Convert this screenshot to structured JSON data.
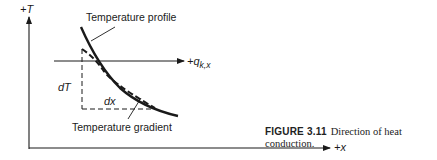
{
  "figure": {
    "number": "FIGURE 3.11",
    "caption": "Direction of heat conduction."
  },
  "axes": {
    "y_label": "+T",
    "x_label": "+x"
  },
  "labels": {
    "temperature_profile": "Temperature profile",
    "temperature_gradient": "Temperature gradient",
    "heat_flux": "+q",
    "heat_flux_subscript": "k,x",
    "dT": "dT",
    "dx": "dx"
  },
  "colors": {
    "ink": "#1a1a1a",
    "background": "#ffffff"
  }
}
